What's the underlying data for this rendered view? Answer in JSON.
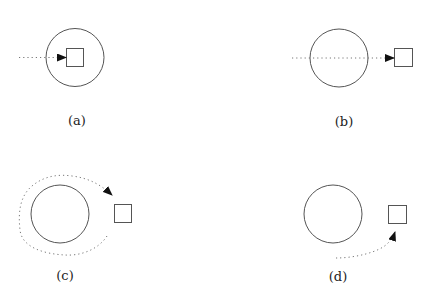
{
  "panels": [
    {
      "id": "a",
      "label": "(a)",
      "description": "dotted path enters circle and reaches square inside circle"
    },
    {
      "id": "b",
      "label": "(b)",
      "description": "dotted path passes through circle and reaches square outside circle"
    },
    {
      "id": "c",
      "label": "(c)",
      "description": "dotted path goes around circle and reaches square outside"
    },
    {
      "id": "d",
      "label": "(d)",
      "description": "dotted path approaches square from below without crossing circle"
    }
  ],
  "colors": {
    "stroke": "#555555",
    "arrow": "#111111",
    "background": "#ffffff"
  }
}
